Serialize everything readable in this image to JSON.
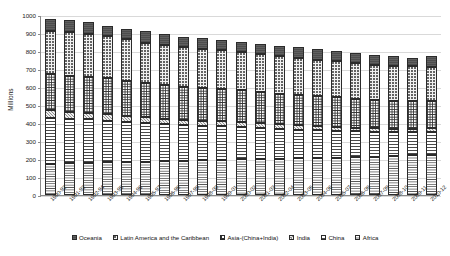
{
  "chart_data": {
    "type": "bar",
    "subtype": "stacked-column",
    "title": "",
    "xlabel": "",
    "ylabel": "Millions",
    "ylim": [
      0,
      1000
    ],
    "ytick_step": 100,
    "yticks": [
      0,
      100,
      200,
      300,
      400,
      500,
      600,
      700,
      800,
      900,
      1000
    ],
    "grid": true,
    "legend_position": "bottom",
    "categories": [
      "1990-92",
      "1991-93",
      "1992-94",
      "1993-95",
      "1994-96",
      "1995-97",
      "1996-98",
      "1997-99",
      "1998-00",
      "1999-01",
      "2000-02",
      "2001-03",
      "2002-04",
      "2003-05",
      "2004-06",
      "2005-07",
      "2006-08",
      "2007-09",
      "2008-10",
      "2009-11",
      "2010-12"
    ],
    "series": [
      {
        "name": "Africa",
        "pattern": "horizontal-lines-fine",
        "values": [
          175,
          178,
          180,
          182,
          184,
          186,
          188,
          190,
          192,
          196,
          198,
          200,
          202,
          203,
          205,
          207,
          210,
          212,
          216,
          220,
          225
        ]
      },
      {
        "name": "China",
        "pattern": "horizontal-lines",
        "values": [
          254,
          246,
          240,
          232,
          222,
          212,
          205,
          198,
          192,
          186,
          180,
          172,
          165,
          160,
          155,
          150,
          143,
          138,
          133,
          130,
          127
        ]
      },
      {
        "name": "India",
        "pattern": "diagonal-crosshatch-grey",
        "values": [
          42,
          40,
          38,
          36,
          34,
          33,
          32,
          31,
          30,
          29,
          28,
          27,
          26,
          25,
          24,
          23,
          22,
          21,
          20,
          19,
          18
        ]
      },
      {
        "name": "Asia-(China+India)",
        "pattern": "grid-crosshatch",
        "values": [
          203,
          200,
          200,
          198,
          195,
          190,
          185,
          182,
          180,
          178,
          175,
          172,
          170,
          168,
          165,
          162,
          160,
          158,
          156,
          154,
          152
        ]
      },
      {
        "name": "Latin America and the Caribbean",
        "pattern": "fine-dots",
        "values": [
          240,
          240,
          238,
          235,
          230,
          225,
          222,
          220,
          218,
          215,
          212,
          210,
          208,
          205,
          202,
          200,
          198,
          196,
          194,
          192,
          190
        ]
      },
      {
        "name": "Oceania",
        "pattern": "solid-dark-grey",
        "values": [
          66,
          66,
          64,
          57,
          60,
          64,
          63,
          59,
          58,
          56,
          57,
          59,
          59,
          59,
          59,
          58,
          57,
          55,
          51,
          45,
          58
        ]
      }
    ],
    "totals": [
      980,
      970,
      960,
      940,
      925,
      910,
      895,
      880,
      870,
      860,
      850,
      840,
      830,
      820,
      810,
      800,
      790,
      780,
      770,
      760,
      770
    ]
  },
  "legend": {
    "items": [
      {
        "label": "Oceania",
        "swatch": "swatch-oceania"
      },
      {
        "label": "Latin America and the Caribbean",
        "swatch": "swatch-lac"
      },
      {
        "label": "Asia-(China+India)",
        "swatch": "swatch-asia"
      },
      {
        "label": "India",
        "swatch": "swatch-india"
      },
      {
        "label": "China",
        "swatch": "swatch-china"
      },
      {
        "label": "Africa",
        "swatch": "swatch-africa"
      }
    ]
  },
  "axis": {
    "y_title": "Millions"
  },
  "colors": {
    "oceania": "#606060",
    "latin_america": "#f2f2f2",
    "asia": "#ffffff",
    "india": "#8f8f8f",
    "china": "#ffffff",
    "africa": "#ffffff",
    "gridline": "#d9d9d9",
    "axis": "#8a8a8a",
    "outline": "#2b2b2b"
  }
}
